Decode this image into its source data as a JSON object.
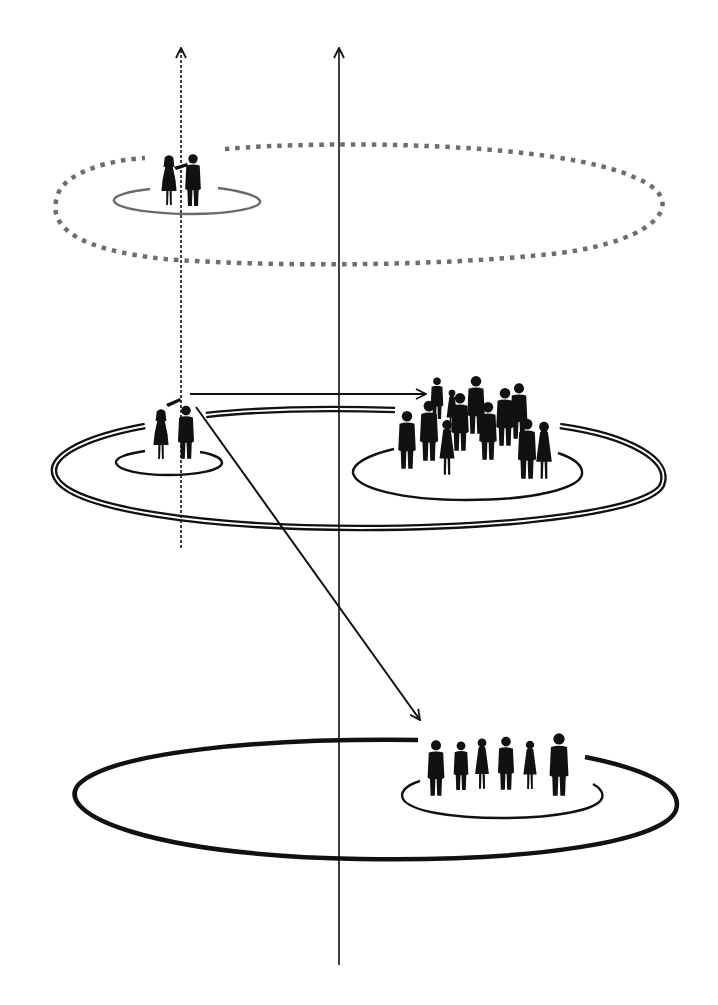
{
  "diagram": {
    "corner_fragment": "",
    "colors": {
      "ink": "#111111",
      "dotted_ring": "#6e6e6e",
      "inner_ring_top": "#6a6a6a",
      "background": "#ffffff"
    },
    "axes": [
      {
        "id": "dashed-axis",
        "style": "dashed",
        "x": 181,
        "y_top": 46,
        "y_bottom": 548,
        "arrow": "up"
      },
      {
        "id": "solid-axis",
        "style": "solid",
        "x": 339,
        "y_top": 46,
        "y_bottom": 965,
        "arrow": "up"
      }
    ],
    "levels": [
      {
        "id": "top",
        "outer_ring": {
          "style": "dotted",
          "cx": 360,
          "cy": 203,
          "rx": 307,
          "ry": 60
        },
        "inner_rings": [
          {
            "cx": 187,
            "cy": 201,
            "rx": 73,
            "ry": 13
          }
        ],
        "groups": [
          {
            "id": "couple-top",
            "people": 2,
            "x": 183,
            "y_feet": 205
          }
        ]
      },
      {
        "id": "middle",
        "outer_ring": {
          "style": "double",
          "cx": 358,
          "cy": 468,
          "rx": 304,
          "ry": 60
        },
        "inner_rings": [
          {
            "cx": 168,
            "cy": 462,
            "rx": 53,
            "ry": 13
          },
          {
            "cx": 467,
            "cy": 472,
            "rx": 115,
            "ry": 29
          }
        ],
        "groups": [
          {
            "id": "couple-middle",
            "people": 2,
            "x": 172,
            "y_feet": 458
          },
          {
            "id": "crowd-middle",
            "people": 12,
            "x": 470,
            "y_feet": 470
          }
        ]
      },
      {
        "id": "bottom",
        "outer_ring": {
          "style": "solid-thick",
          "cx": 373,
          "cy": 798,
          "rx": 303,
          "ry": 61
        },
        "inner_rings": [
          {
            "cx": 502,
            "cy": 791,
            "rx": 100,
            "ry": 25
          }
        ],
        "groups": [
          {
            "id": "group-bottom",
            "people": 6,
            "x": 497,
            "y_feet": 795
          }
        ]
      }
    ],
    "arrows": [
      {
        "id": "arrow-couple-to-crowd",
        "from": [
          190,
          394
        ],
        "to": [
          425,
          394
        ],
        "style": "solid"
      },
      {
        "id": "arrow-couple-to-bottom-group",
        "from": [
          196,
          407
        ],
        "to": [
          419,
          720
        ],
        "style": "solid"
      }
    ]
  }
}
